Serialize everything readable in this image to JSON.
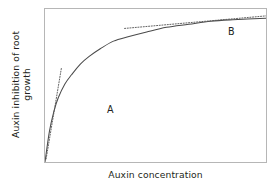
{
  "figure": {
    "background_color": "#ffffff",
    "frame_color": "#b6b6b6"
  },
  "chart_data": {
    "type": "line",
    "title": "",
    "subtitle": "",
    "xlabel": "Auxin concentration",
    "ylabel": "Auxin inhibition of root growth",
    "ylabel_line1": "Auxin inhibition of root",
    "ylabel_line2": "growth",
    "grid": false,
    "legend": false,
    "legend_position": "none",
    "axis_ticks": false,
    "tick_labels_x": [],
    "tick_labels_y": [],
    "xlim": [
      0,
      1
    ],
    "ylim": [
      0,
      1
    ],
    "curve_color": "#4a4a4a",
    "tangent_color": "#5a5a5a",
    "series": [
      {
        "name": "Auxin inhibition of root growth",
        "style": "solid",
        "x": [
          0.0,
          0.02,
          0.04,
          0.06,
          0.09,
          0.12,
          0.16,
          0.2,
          0.25,
          0.31,
          0.38,
          0.46,
          0.55,
          0.65,
          0.75,
          0.85,
          1.0
        ],
        "y": [
          0.0,
          0.2,
          0.33,
          0.42,
          0.51,
          0.57,
          0.64,
          0.69,
          0.74,
          0.79,
          0.82,
          0.85,
          0.88,
          0.9,
          0.92,
          0.93,
          0.94
        ]
      }
    ],
    "annotations": [
      {
        "label": "A",
        "kind": "tangent",
        "style": "dotted",
        "at_x": 0.03,
        "at_y": 0.27,
        "slope": "steep",
        "line_x": [
          0.005,
          0.075
        ],
        "line_y": [
          0.02,
          0.62
        ]
      },
      {
        "label": "B",
        "kind": "tangent",
        "style": "dotted",
        "at_x": 0.68,
        "at_y": 0.905,
        "slope": "shallow",
        "line_x": [
          0.36,
          1.0
        ],
        "line_y": [
          0.873,
          0.955
        ]
      }
    ]
  },
  "labels": {
    "point_a": "A",
    "point_b": "B"
  }
}
